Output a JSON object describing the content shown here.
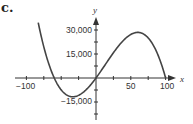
{
  "part_label": "c.",
  "chart_data": {
    "type": "line",
    "title": "",
    "xlabel": "x",
    "ylabel": "y",
    "xlim": [
      -110,
      110
    ],
    "ylim": [
      -20000,
      40000
    ],
    "x_ticks": [
      -100,
      -75,
      -50,
      -25,
      0,
      25,
      50,
      75,
      100
    ],
    "x_tick_labels": [
      "-100",
      "50",
      "100"
    ],
    "y_ticks": [
      -22500,
      -15000,
      -7500,
      7500,
      15000,
      22500,
      30000
    ],
    "y_tick_labels": [
      "30,000",
      "15,000",
      "−15,000"
    ],
    "grid": false,
    "series": [
      {
        "name": "cubic",
        "x": [
          -83,
          -75,
          -60,
          -50,
          -36,
          -25,
          0,
          25,
          50,
          60,
          75,
          90,
          100
        ],
        "values": [
          34500,
          22300,
          0,
          -7500,
          -11600,
          -10300,
          0,
          15800,
          27200,
          28500,
          24900,
          14300,
          0
        ]
      }
    ],
    "key_points": {
      "roots": [
        -60,
        0,
        100
      ],
      "local_min": [
        -36,
        -11600
      ],
      "local_max": [
        60,
        28500
      ]
    }
  },
  "labels": {
    "x_neg100": "−100",
    "x_50": "50",
    "x_100": "100",
    "y_30000": "30,000",
    "y_15000": "15,000",
    "y_neg15000": "−15,000",
    "x_var": "x",
    "y_var": "y"
  }
}
